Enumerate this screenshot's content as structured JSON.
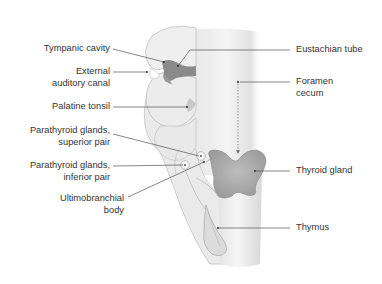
{
  "diagram": {
    "type": "anatomical-illustration",
    "colors": {
      "background": "#ffffff",
      "pouch_fill": "#e8e8e8",
      "pharynx_fill": "#eeeeee",
      "gland_fill": "#a6a6a6",
      "leader_line": "#555555",
      "text": "#333333"
    },
    "labels_left": [
      {
        "id": "tympanic-cavity",
        "lines": [
          "Tympanic cavity"
        ]
      },
      {
        "id": "external-auditory-canal",
        "lines": [
          "External",
          "auditory canal"
        ]
      },
      {
        "id": "palatine-tonsil",
        "lines": [
          "Palatine tonsil"
        ]
      },
      {
        "id": "parathyroid-superior",
        "lines": [
          "Parathyroid glands,",
          "superior pair"
        ]
      },
      {
        "id": "parathyroid-inferior",
        "lines": [
          "Parathyroid glands,",
          "inferior pair"
        ]
      },
      {
        "id": "ultimobranchial-body",
        "lines": [
          "Ultimobranchial",
          "body"
        ]
      }
    ],
    "labels_right": [
      {
        "id": "eustachian-tube",
        "lines": [
          "Eustachian tube"
        ]
      },
      {
        "id": "foramen-cecum",
        "lines": [
          "Foramen",
          "cecum"
        ]
      },
      {
        "id": "thyroid-gland",
        "lines": [
          "Thyroid gland"
        ]
      },
      {
        "id": "thymus",
        "lines": [
          "Thymus"
        ]
      }
    ]
  }
}
